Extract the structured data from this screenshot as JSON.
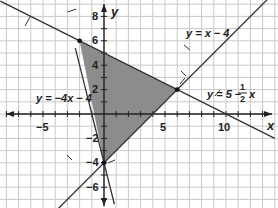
{
  "chart_data": {
    "type": "line",
    "title": "",
    "xlabel": "x",
    "ylabel": "y",
    "xlim": [
      -8.5,
      14
    ],
    "ylim": [
      -7.5,
      9.3
    ],
    "grid": true,
    "x_ticks": [
      -5,
      5,
      10
    ],
    "y_ticks": [
      8,
      6,
      4,
      2,
      -2,
      -4,
      -6
    ],
    "lines": [
      {
        "name": "y = -4x - 4",
        "label": "y = −4x − 4",
        "slope": -4,
        "intercept": -4
      },
      {
        "name": "y = x - 4",
        "label": "y = x − 4",
        "slope": 1,
        "intercept": -4
      },
      {
        "name": "y = 5 - 1/2 x",
        "label": "y = 5 − ½ x",
        "slope": -0.5,
        "intercept": 5
      }
    ],
    "feasible_region": {
      "type": "polygon",
      "vertices": [
        [
          -2,
          6
        ],
        [
          6,
          2
        ],
        [
          0,
          -4
        ]
      ],
      "fill": "#8a8a8a"
    },
    "points": [
      [
        -2,
        6
      ],
      [
        6,
        2
      ],
      [
        0,
        -4
      ]
    ]
  },
  "labels": {
    "x_axis": "x",
    "y_axis": "y",
    "tick_neg5": "−5",
    "tick_5": "5",
    "tick_10": "10",
    "tick_8": "8",
    "tick_6": "6",
    "tick_4": "4",
    "tick_2": "2",
    "tick_neg2": "−2",
    "tick_neg4": "−4",
    "tick_neg6": "−6",
    "eq1": "y = x − 4",
    "eq2": "y = −4x − 4",
    "eq3_prefix": "y = 5 − ",
    "eq3_num": "1",
    "eq3_den": "2",
    "eq3_suffix": "x"
  },
  "colors": {
    "grid": "#c8c8c8",
    "axis": "#222222",
    "line": "#333333",
    "fill": "#8c8c8c"
  }
}
